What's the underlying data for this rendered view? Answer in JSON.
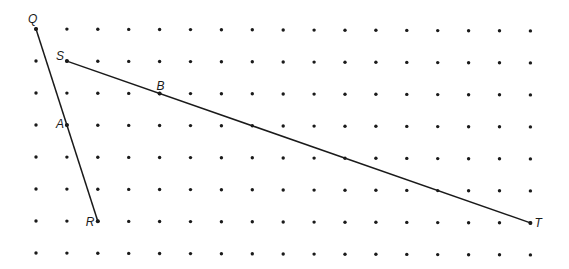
{
  "diagram": {
    "type": "dot-grid-geometry",
    "grid": {
      "columns": 17,
      "rows": 8,
      "origin_px": [
        36,
        29
      ],
      "spacing_px": [
        30.9,
        32
      ],
      "dot_color": "#1a1a1a"
    },
    "points": [
      {
        "label": "Q",
        "col": 0,
        "row": 0,
        "label_dx": -8,
        "label_dy": -6
      },
      {
        "label": "S",
        "col": 1,
        "row": 1,
        "label_dx": -11,
        "label_dy": -1
      },
      {
        "label": "B",
        "col": 4,
        "row": 2,
        "label_dx": -3,
        "label_dy": -4
      },
      {
        "label": "A",
        "col": 1,
        "row": 3,
        "label_dx": -11,
        "label_dy": 3
      },
      {
        "label": "R",
        "col": 2,
        "row": 6,
        "label_dx": -12,
        "label_dy": 5
      },
      {
        "label": "T",
        "col": 16,
        "row": 6,
        "label_dx": 4,
        "label_dy": 4
      }
    ],
    "segments": [
      {
        "name": "QR",
        "from": "Q",
        "to": "R"
      },
      {
        "name": "ST",
        "from": "S",
        "to": "T"
      }
    ],
    "line_color": "#1a1a1a"
  }
}
